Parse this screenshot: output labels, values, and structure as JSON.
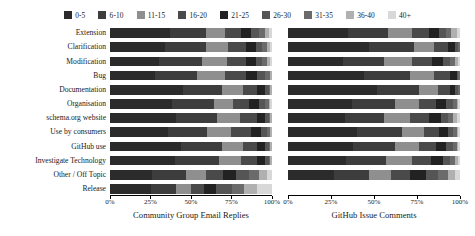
{
  "chart_data": {
    "type": "bar",
    "title": "",
    "orientation": "horizontal",
    "stacked": true,
    "normalized": "100%",
    "grid": false,
    "legend_position": "top",
    "xlabel": "",
    "ylabel": "",
    "xlim": [
      0,
      100
    ],
    "xticks": [
      0,
      25,
      50,
      75,
      100
    ],
    "xticklabels": [
      "0%",
      "25%",
      "50%",
      "75%",
      "100%"
    ],
    "categories": [
      "Extension",
      "Clarification",
      "Modification",
      "Bug",
      "Documentation",
      "Organisation",
      "schema.org website",
      "Use by consumers",
      "GitHub use",
      "Investigate Technology",
      "Other / Off Topic",
      "Release"
    ],
    "bins": [
      "0-5",
      "6-10",
      "11-15",
      "16-20",
      "21-25",
      "26-30",
      "31-35",
      "36-40",
      "40+"
    ],
    "bin_colors": [
      "#2b2b2b",
      "#3d3d3d",
      "#8f8f8f",
      "#4a4a4a",
      "#222222",
      "#555555",
      "#6b6b6b",
      "#b0b0b0",
      "#d8d8d8"
    ],
    "panels": [
      {
        "name": "community-group-email-replies",
        "title": "Community Group Email Replies",
        "series": [
          {
            "name": "0-5",
            "values": [
              37,
              34,
              30,
              28,
              45,
              38,
              41,
              36,
              44,
              40,
              26,
              28
            ]
          },
          {
            "name": "6-10",
            "values": [
              22,
              25,
              27,
              26,
              24,
              26,
              25,
              24,
              25,
              27,
              21,
              17
            ]
          },
          {
            "name": "11-15",
            "values": [
              12,
              14,
              15,
              17,
              13,
              12,
              14,
              15,
              13,
              14,
              12,
              10
            ]
          },
          {
            "name": "16-20",
            "values": [
              10,
              11,
              12,
              13,
              9,
              10,
              11,
              12,
              9,
              10,
              11,
              9
            ]
          },
          {
            "name": "21-25",
            "values": [
              6,
              6,
              6,
              7,
              5,
              6,
              5,
              6,
              5,
              5,
              8,
              8
            ]
          },
          {
            "name": "26-30",
            "values": [
              5,
              4,
              4,
              5,
              2,
              4,
              2,
              4,
              2,
              2,
              8,
              11
            ]
          },
          {
            "name": "31-35",
            "values": [
              4,
              3,
              3,
              3,
              1,
              2,
              1,
              2,
              1,
              1,
              6,
              8
            ]
          },
          {
            "name": "36-40",
            "values": [
              2,
              2,
              2,
              1,
              1,
              1,
              1,
              1,
              1,
              1,
              5,
              9
            ]
          },
          {
            "name": "40+",
            "values": [
              2,
              1,
              1,
              0,
              0,
              1,
              0,
              0,
              0,
              0,
              3,
              10
            ]
          }
        ]
      },
      {
        "name": "github-issue-comments",
        "title": "GitHub Issue Comments",
        "series": [
          {
            "name": "0-5",
            "values": [
              35,
              47,
              32,
              44,
              52,
              37,
              33,
              40,
              38,
              34,
              27,
              0
            ]
          },
          {
            "name": "6-10",
            "values": [
              23,
              26,
              24,
              27,
              24,
              25,
              23,
              26,
              24,
              23,
              20,
              0
            ]
          },
          {
            "name": "11-15",
            "values": [
              14,
              12,
              16,
              14,
              11,
              14,
              15,
              13,
              14,
              15,
              13,
              0
            ]
          },
          {
            "name": "16-20",
            "values": [
              10,
              8,
              12,
              9,
              7,
              10,
              11,
              9,
              10,
              11,
              11,
              0
            ]
          },
          {
            "name": "21-25",
            "values": [
              6,
              4,
              6,
              4,
              3,
              6,
              7,
              5,
              6,
              7,
              9,
              0
            ]
          },
          {
            "name": "26-30",
            "values": [
              4,
              2,
              4,
              1,
              2,
              4,
              4,
              3,
              4,
              4,
              7,
              0
            ]
          },
          {
            "name": "31-35",
            "values": [
              3,
              1,
              3,
              1,
              1,
              2,
              3,
              2,
              2,
              3,
              6,
              0
            ]
          },
          {
            "name": "36-40",
            "values": [
              3,
              0,
              2,
              0,
              0,
              1,
              2,
              1,
              1,
              2,
              4,
              0
            ]
          },
          {
            "name": "40+",
            "values": [
              2,
              0,
              1,
              0,
              0,
              1,
              2,
              1,
              1,
              1,
              3,
              0
            ]
          }
        ]
      }
    ]
  }
}
